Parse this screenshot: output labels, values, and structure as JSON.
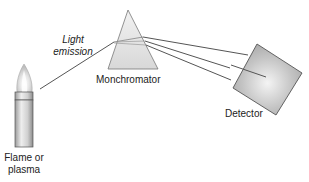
{
  "diagram": {
    "labels": {
      "light_emission_line1": "Light",
      "light_emission_line2": "emission",
      "monochromator": "Monchromator",
      "detector": "Detector",
      "source_line1": "Flame or",
      "source_line2": "plasma"
    },
    "components": [
      {
        "id": "source",
        "name": "Flame or plasma"
      },
      {
        "id": "monochromator",
        "name": "Monchromator",
        "shape": "prism"
      },
      {
        "id": "detector",
        "name": "Detector",
        "shape": "square"
      }
    ],
    "beams": {
      "incident": {
        "from": "source",
        "to": "monochromator"
      },
      "dispersed_count": 3
    },
    "colors": {
      "line": "#555555",
      "prism_fill": "#e6e6e6",
      "detector_fill": "#b8b8b8",
      "tube": "#cfcfcf"
    }
  }
}
